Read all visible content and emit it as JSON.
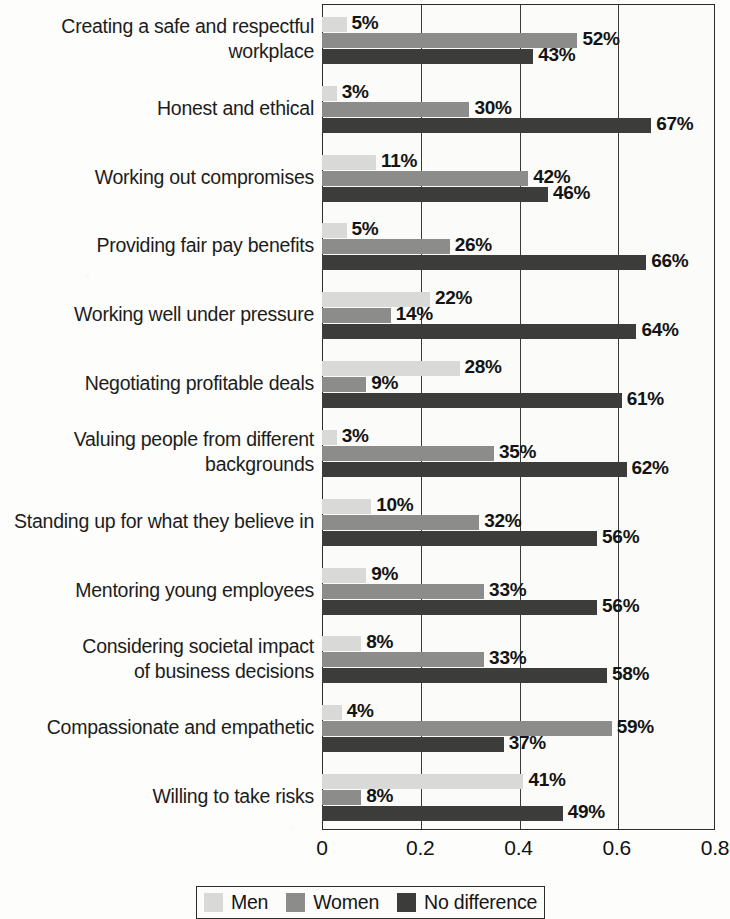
{
  "chart_data": {
    "type": "bar",
    "orientation": "horizontal",
    "title": "",
    "subtitle": "",
    "xlabel": "",
    "ylabel": "",
    "xlim": [
      0,
      0.8
    ],
    "xticks": [
      "0",
      "0.2",
      "0.4",
      "0.6",
      "0.8"
    ],
    "xtick_values": [
      0,
      0.2,
      0.4,
      0.6,
      0.8
    ],
    "grid": true,
    "grid_axis": "x",
    "legend_position": "bottom",
    "categories": [
      "Creating a safe and respectful workplace",
      "Honest and ethical",
      "Working out compromises",
      "Providing fair pay benefits",
      "Working well under pressure",
      "Negotiating profitable deals",
      "Valuing people from different backgrounds",
      "Standing up for what they believe in",
      "Mentoring young employees",
      "Considering societal impact of business decisions",
      "Compassionate and empathetic",
      "Willing to take risks"
    ],
    "category_lines": [
      [
        "Creating a safe and respectful",
        "workplace"
      ],
      [
        "Honest and ethical"
      ],
      [
        "Working out compromises"
      ],
      [
        "Providing fair pay benefits"
      ],
      [
        "Working well under pressure"
      ],
      [
        "Negotiating profitable deals"
      ],
      [
        "Valuing people from different",
        "backgrounds"
      ],
      [
        "Standing up for what they believe in"
      ],
      [
        "Mentoring young employees"
      ],
      [
        "Considering societal impact",
        "of business decisions"
      ],
      [
        "Compassionate and empathetic"
      ],
      [
        "Willing to take risks"
      ]
    ],
    "series": [
      {
        "name": "Men",
        "color": "#d9d9d7",
        "values": [
          0.05,
          0.03,
          0.11,
          0.05,
          0.22,
          0.28,
          0.03,
          0.1,
          0.09,
          0.08,
          0.04,
          0.41
        ],
        "labels": [
          "5%",
          "3%",
          "11%",
          "5%",
          "22%",
          "28%",
          "3%",
          "10%",
          "9%",
          "8%",
          "4%",
          "41%"
        ]
      },
      {
        "name": "Women",
        "color": "#8c8c8a",
        "values": [
          0.52,
          0.3,
          0.42,
          0.26,
          0.14,
          0.09,
          0.35,
          0.32,
          0.33,
          0.33,
          0.59,
          0.08
        ],
        "labels": [
          "52%",
          "30%",
          "42%",
          "26%",
          "14%",
          "9%",
          "35%",
          "32%",
          "33%",
          "33%",
          "59%",
          "8%"
        ]
      },
      {
        "name": "No difference",
        "color": "#3c3c3a",
        "values": [
          0.43,
          0.67,
          0.46,
          0.66,
          0.64,
          0.61,
          0.62,
          0.56,
          0.56,
          0.58,
          0.37,
          0.49
        ],
        "labels": [
          "43%",
          "67%",
          "46%",
          "66%",
          "64%",
          "61%",
          "62%",
          "56%",
          "56%",
          "58%",
          "37%",
          "49%"
        ]
      }
    ]
  },
  "legend": {
    "items": [
      {
        "label": "Men",
        "color": "#d9d9d7"
      },
      {
        "label": "Women",
        "color": "#8c8c8a"
      },
      {
        "label": "No difference",
        "color": "#3c3c3a"
      }
    ]
  },
  "axis": {
    "ticks": [
      "0",
      "0.2",
      "0.4",
      "0.6",
      "0.8"
    ]
  }
}
